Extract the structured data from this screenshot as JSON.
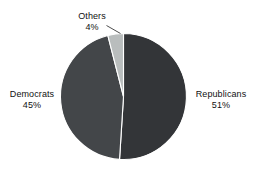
{
  "chart_data": {
    "type": "pie",
    "title": "",
    "subtitle": "",
    "xlabel": "",
    "ylabel": "",
    "legend": "none",
    "grid": false,
    "labels_inline": true,
    "categories": [
      "Republicans",
      "Democrats",
      "Others"
    ],
    "values": [
      51,
      45,
      4
    ],
    "value_suffix": "%",
    "slices": [
      {
        "name": "Republicans",
        "label": "Republicans",
        "value": 51,
        "value_text": "51%",
        "color": "#333538",
        "start_angle_deg": 0,
        "end_angle_deg": 183.6,
        "label_position": "right"
      },
      {
        "name": "Democrats",
        "label": "Democrats",
        "value": 45,
        "value_text": "45%",
        "color": "#434649",
        "start_angle_deg": 183.6,
        "end_angle_deg": 345.6,
        "label_position": "left"
      },
      {
        "name": "Others",
        "label": "Others",
        "value": 4,
        "value_text": "4%",
        "color": "#b9bdbd",
        "start_angle_deg": 345.6,
        "end_angle_deg": 360,
        "label_position": "top",
        "has_leader_line": true
      }
    ],
    "colors": {
      "republicans": "#333538",
      "democrats": "#434649",
      "others": "#b9bdbd",
      "slice_separator": "#ffffff",
      "background": "#ffffff",
      "text": "#111111",
      "leader_line": "#3a3a3a"
    }
  },
  "labels": {
    "others": {
      "name": "Others",
      "value": "4%"
    },
    "democrats": {
      "name": "Democrats",
      "value": "45%"
    },
    "republicans": {
      "name": "Republicans",
      "value": "51%"
    }
  }
}
